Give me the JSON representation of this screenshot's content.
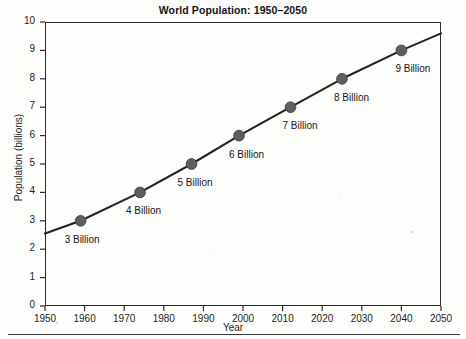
{
  "chart_data": {
    "type": "line",
    "title": "World Population: 1950–2050",
    "xlabel": "Year",
    "ylabel": "Population (billions)",
    "xlim": [
      1950,
      2050
    ],
    "ylim": [
      0,
      10
    ],
    "grid": false,
    "legend": null,
    "xticks": [
      1950,
      1960,
      1970,
      1980,
      1990,
      2000,
      2010,
      2020,
      2030,
      2040,
      2050
    ],
    "yticks": [
      0,
      1,
      2,
      3,
      4,
      5,
      6,
      7,
      8,
      9,
      10
    ],
    "line_endpoints": [
      {
        "x": 1950,
        "y": 2.55
      },
      {
        "x": 2050,
        "y": 9.6
      }
    ],
    "series": [
      {
        "name": "World population",
        "marker_color": "#5e5e5e",
        "line_color": "#242424",
        "points": [
          {
            "x": 1959,
            "y": 3,
            "label": "3 Billion"
          },
          {
            "x": 1974,
            "y": 4,
            "label": "4 Billion"
          },
          {
            "x": 1987,
            "y": 5,
            "label": "5 Billion"
          },
          {
            "x": 1999,
            "y": 6,
            "label": "6 Billion"
          },
          {
            "x": 2012,
            "y": 7,
            "label": "7 Billion"
          },
          {
            "x": 2025,
            "y": 8,
            "label": "8 Billion"
          },
          {
            "x": 2040,
            "y": 9,
            "label": "9 Billion"
          }
        ]
      }
    ]
  },
  "colors": {
    "axis": "#2b2b2b",
    "line": "#242424",
    "marker": "#5e5e5e",
    "text": "#161616",
    "background": "#fdfdfc"
  }
}
